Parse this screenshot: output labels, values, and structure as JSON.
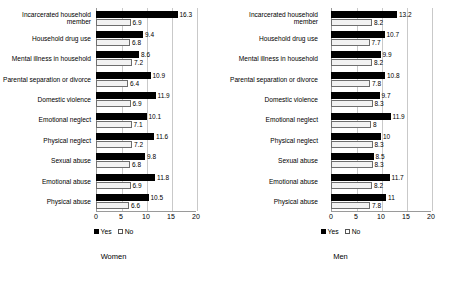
{
  "legend": {
    "yes": "Yes",
    "no": "No"
  },
  "axis": {
    "ticks": [
      0,
      5,
      10,
      15,
      20
    ],
    "min": 0,
    "max": 20
  },
  "categories": [
    "Incarcerated household member",
    "Household drug use",
    "Mental illness in household",
    "Parental separation or divorce",
    "Domestic violence",
    "Emotional neglect",
    "Physical neglect",
    "Sexual abuse",
    "Emotional abuse",
    "Physical abuse"
  ],
  "panels": [
    {
      "title": "Women"
    },
    {
      "title": "Men"
    }
  ],
  "chart_data": [
    {
      "type": "bar",
      "title": "Women",
      "orientation": "horizontal",
      "xlabel": "",
      "ylabel": "",
      "xlim": [
        0,
        20
      ],
      "xticks": [
        0,
        5,
        10,
        15,
        20
      ],
      "grid": true,
      "legend_position": "bottom",
      "categories": [
        "Incarcerated household member",
        "Household drug use",
        "Mental illness in household",
        "Parental separation or divorce",
        "Domestic violence",
        "Emotional neglect",
        "Physical neglect",
        "Sexual abuse",
        "Emotional abuse",
        "Physical abuse"
      ],
      "series": [
        {
          "name": "Yes",
          "values": [
            16.3,
            9.4,
            8.6,
            10.9,
            11.9,
            10.1,
            11.6,
            9.8,
            11.8,
            10.5
          ]
        },
        {
          "name": "No",
          "values": [
            6.9,
            6.8,
            7.2,
            6.4,
            6.9,
            7.1,
            7.2,
            6.8,
            6.9,
            6.6
          ]
        }
      ]
    },
    {
      "type": "bar",
      "title": "Men",
      "orientation": "horizontal",
      "xlabel": "",
      "ylabel": "",
      "xlim": [
        0,
        20
      ],
      "xticks": [
        0,
        5,
        10,
        15,
        20
      ],
      "grid": true,
      "legend_position": "bottom",
      "categories": [
        "Incarcerated household member",
        "Household drug use",
        "Mental illness in household",
        "Parental separation or divorce",
        "Domestic violence",
        "Emotional neglect",
        "Physical neglect",
        "Sexual abuse",
        "Emotional abuse",
        "Physical abuse"
      ],
      "series": [
        {
          "name": "Yes",
          "values": [
            13.2,
            10.7,
            9.9,
            10.8,
            9.7,
            11.9,
            10,
            8.5,
            11.7,
            11
          ]
        },
        {
          "name": "No",
          "values": [
            8.2,
            7.7,
            8.2,
            7.8,
            8.3,
            8,
            8.3,
            8.3,
            8.2,
            7.8
          ]
        }
      ]
    }
  ]
}
